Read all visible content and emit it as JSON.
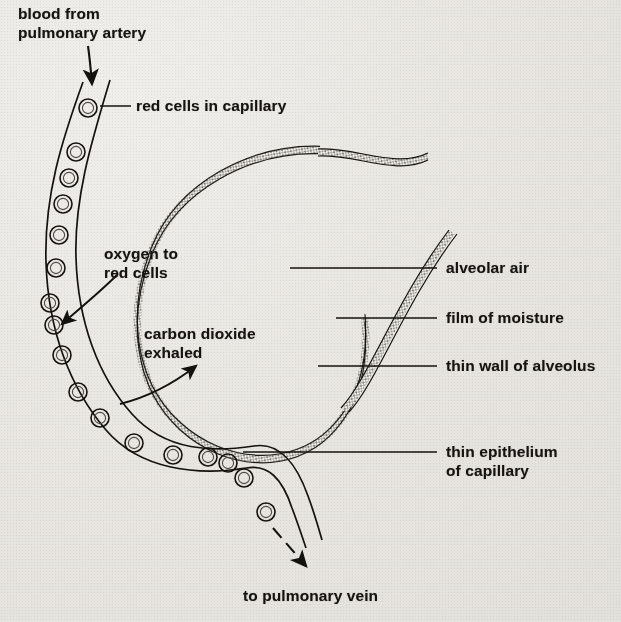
{
  "figure": {
    "type": "biological-diagram",
    "background_color": "#e7e5e0",
    "ink_color": "#14120e"
  },
  "labels": {
    "blood_from_pulmonary_artery": "blood from\npulmonary artery",
    "red_cells_in_capillary": "red cells in capillary",
    "oxygen_to_red_cells": "oxygen to\nred cells",
    "carbon_dioxide_exhaled": "carbon dioxide\nexhaled",
    "alveolar_air": "alveolar air",
    "film_of_moisture": "film of moisture",
    "thin_wall_of_alveolus": "thin wall of alveolus",
    "thin_epithelium_of_capillary": "thin epithelium\nof capillary",
    "to_pulmonary_vein": "to pulmonary vein"
  },
  "label_lines": [
    {
      "name": "red-cells-leader",
      "x1": 100,
      "y1": 106,
      "x2": 131,
      "y2": 106
    },
    {
      "name": "alveolar-air-leader",
      "x1": 290,
      "y1": 268,
      "x2": 437,
      "y2": 268
    },
    {
      "name": "film-of-moisture-leader",
      "x1": 336,
      "y1": 318,
      "x2": 437,
      "y2": 318
    },
    {
      "name": "thin-wall-leader",
      "x1": 318,
      "y1": 366,
      "x2": 437,
      "y2": 366
    },
    {
      "name": "thin-epithelium-leader",
      "x1": 243,
      "y1": 452,
      "x2": 437,
      "y2": 452
    }
  ],
  "arrows": [
    {
      "name": "inflow-arrow",
      "label": "blood from pulmonary artery",
      "direction": "down"
    },
    {
      "name": "outflow-arrow",
      "label": "to pulmonary vein",
      "direction": "down-right",
      "style": "dashed"
    },
    {
      "name": "oxygen-arrow",
      "label": "oxygen to red cells",
      "direction": "left-into-capillary"
    },
    {
      "name": "carbon-dioxide-arrow",
      "label": "carbon dioxide exhaled",
      "direction": "up-right"
    }
  ],
  "red_cells": {
    "count": 19,
    "shape": "double-circle",
    "radius": 9
  },
  "alveolus": {
    "shape": "sphere-with-duct",
    "wall_style": "double-line-stippled"
  }
}
